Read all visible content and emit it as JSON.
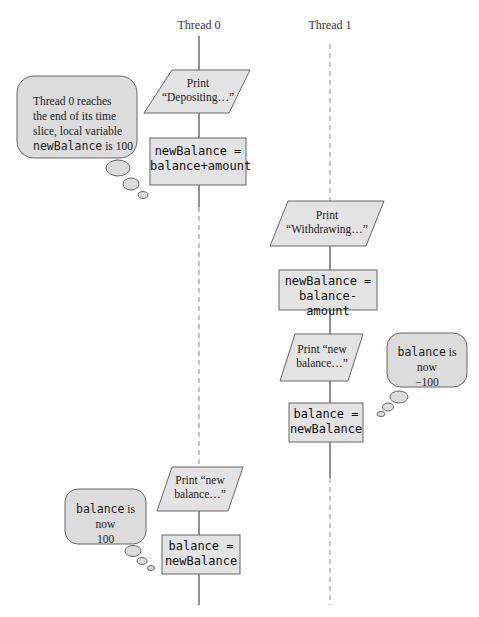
{
  "threads": [
    {
      "label": "Thread 0"
    },
    {
      "label": "Thread 1"
    }
  ],
  "colors": {
    "shape_fill": "#e3e3e3",
    "shape_stroke": "#666666",
    "line_solid": "#555555",
    "line_dashed": "#8a8a8a",
    "bubble_fill": "#dcdcdc",
    "bubble_stroke": "#666666"
  },
  "thread0": {
    "print1": {
      "line1": "Print",
      "line2": "“Depositing…”"
    },
    "assign1": {
      "line1": "newBalance =",
      "line2": "balance+amount"
    },
    "print2": {
      "line1": "Print “new",
      "line2": "balance…”"
    },
    "assign2": {
      "line1": "balance =",
      "line2": "newBalance"
    }
  },
  "thread1": {
    "print1": {
      "line1": "Print",
      "line2": "“Withdrawing…”"
    },
    "assign1": {
      "line1": "newBalance =",
      "line2": "balance-amount"
    },
    "print2": {
      "line1": "Print “new",
      "line2": "balance…”"
    },
    "assign2": {
      "line1": "balance =",
      "line2": "newBalance"
    }
  },
  "bubbles": [
    {
      "line1": "Thread 0 reaches",
      "line2": "the end of its time",
      "line3": "slice, local variable",
      "code": "newBalance",
      "suffix": " is 100"
    },
    {
      "code": "balance",
      "suffix": " is now",
      "line2": "−100"
    },
    {
      "code": "balance",
      "suffix": " is now",
      "line2": "100"
    }
  ]
}
